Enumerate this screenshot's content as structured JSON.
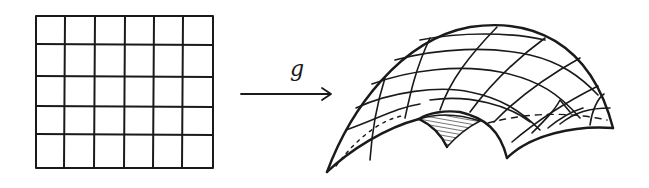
{
  "figure": {
    "source_grid": {
      "columns": 6,
      "rows": 5
    },
    "mapping": {
      "label": "g",
      "arrow_direction": "right"
    },
    "target_surface": {
      "grid_columns": 6,
      "grid_rows": 5,
      "shaded_region": "underside notch",
      "hidden_edge": "dashed"
    }
  },
  "colors": {
    "ink": "#1a1a1a",
    "background": "#ffffff"
  }
}
